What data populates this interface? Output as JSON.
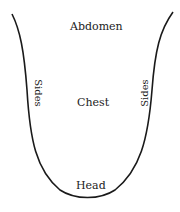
{
  "diagram": {
    "labels": {
      "top": "Abdomen",
      "center": "Chest",
      "bottom": "Head",
      "left_side": "Sides",
      "right_side": "Sides"
    },
    "colors": {
      "stroke": "#1a1a1a",
      "text": "#222222",
      "background": "#ffffff"
    }
  }
}
